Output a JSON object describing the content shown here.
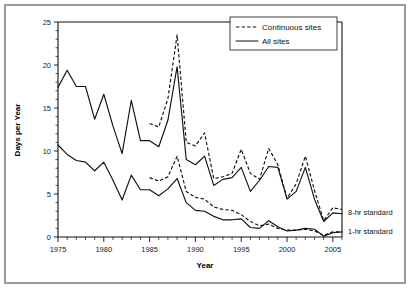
{
  "chart_data": {
    "type": "line",
    "title": "",
    "xlabel": "Year",
    "ylabel": "Days per Year",
    "xlim": [
      1975,
      2006
    ],
    "ylim": [
      0,
      25
    ],
    "xticks": [
      1975,
      1980,
      1985,
      1990,
      1995,
      2000,
      2005
    ],
    "yticks": [
      0,
      5,
      10,
      15,
      20,
      25
    ],
    "grid": false,
    "legend_position": "top-right",
    "x": [
      1975,
      1976,
      1977,
      1978,
      1979,
      1980,
      1981,
      1982,
      1983,
      1984,
      1985,
      1986,
      1987,
      1988,
      1989,
      1990,
      1991,
      1992,
      1993,
      1994,
      1995,
      1996,
      1997,
      1998,
      1999,
      2000,
      2001,
      2002,
      2003,
      2004,
      2005,
      2006
    ],
    "series": [
      {
        "name": "Continuous sites",
        "style": "dashed",
        "standard": "8-hr standard",
        "x": [
          1985,
          1986,
          1987,
          1988,
          1989,
          1990,
          1991,
          1992,
          1993,
          1994,
          1995,
          1996,
          1997,
          1998,
          1999,
          2000,
          2001,
          2002,
          2003,
          2004,
          2005,
          2006
        ],
        "values": [
          13.2,
          12.8,
          16.1,
          23.5,
          11.0,
          10.6,
          12.1,
          6.8,
          7.0,
          7.4,
          10.2,
          7.4,
          6.7,
          10.3,
          8.4,
          4.5,
          6.2,
          9.4,
          5.4,
          1.9,
          3.4,
          3.2
        ]
      },
      {
        "name": "All sites",
        "style": "solid",
        "standard": "8-hr standard",
        "x": [
          1975,
          1976,
          1977,
          1978,
          1979,
          1980,
          1981,
          1982,
          1983,
          1984,
          1985,
          1986,
          1987,
          1988,
          1989,
          1990,
          1991,
          1992,
          1993,
          1994,
          1995,
          1996,
          1997,
          1998,
          1999,
          2000,
          2001,
          2002,
          2003,
          2004,
          2005,
          2006
        ],
        "values": [
          17.4,
          19.4,
          17.5,
          17.5,
          13.7,
          16.6,
          12.9,
          9.7,
          15.9,
          11.2,
          11.2,
          10.5,
          13.6,
          19.8,
          9.0,
          8.4,
          9.4,
          6.0,
          6.7,
          6.9,
          8.1,
          5.3,
          6.6,
          8.2,
          8.1,
          4.4,
          5.3,
          8.1,
          4.4,
          1.8,
          2.8,
          2.7
        ]
      },
      {
        "name": "Continuous sites",
        "style": "dashed",
        "standard": "1-hr standard",
        "x": [
          1985,
          1986,
          1987,
          1988,
          1989,
          1990,
          1991,
          1992,
          1993,
          1994,
          1995,
          1996,
          1997,
          1998,
          1999,
          2000,
          2001,
          2002,
          2003,
          2004,
          2005,
          2006
        ],
        "values": [
          6.9,
          6.5,
          7.0,
          9.4,
          5.3,
          4.6,
          4.4,
          3.5,
          3.2,
          3.1,
          2.6,
          1.8,
          1.3,
          1.5,
          1.0,
          0.8,
          0.8,
          0.9,
          0.7,
          0.2,
          0.6,
          0.6
        ]
      },
      {
        "name": "All sites",
        "style": "solid",
        "standard": "1-hr standard",
        "x": [
          1975,
          1976,
          1977,
          1978,
          1979,
          1980,
          1981,
          1982,
          1983,
          1984,
          1985,
          1986,
          1987,
          1988,
          1989,
          1990,
          1991,
          1992,
          1993,
          1994,
          1995,
          1996,
          1997,
          1998,
          1999,
          2000,
          2001,
          2002,
          2003,
          2004,
          2005,
          2006
        ],
        "values": [
          10.7,
          9.6,
          8.9,
          8.7,
          7.7,
          8.7,
          6.6,
          4.3,
          7.2,
          5.5,
          5.5,
          4.8,
          5.6,
          6.8,
          4.0,
          3.1,
          3.0,
          2.4,
          2.0,
          2.0,
          2.1,
          1.1,
          1.0,
          1.9,
          1.2,
          0.7,
          0.8,
          1.0,
          0.9,
          0.1,
          0.5,
          0.6
        ]
      }
    ],
    "annotations": [
      {
        "text": "8-hr standard",
        "y_value": 2.9
      },
      {
        "text": "1-hr standard",
        "y_value": 0.6
      }
    ],
    "legend": [
      {
        "label": "Continuous sites",
        "style": "dashed"
      },
      {
        "label": "All sites",
        "style": "solid"
      }
    ]
  }
}
